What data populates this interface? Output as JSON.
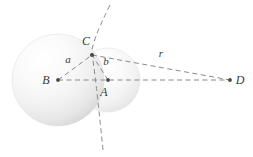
{
  "figure": {
    "background_color": "#ffffff",
    "line_color": "#7a7a7a",
    "label_color": "#3a3a3a",
    "sphere_fill_light": "#fdfdfd",
    "sphere_fill_mid": "#f0f0f0",
    "sphere_fill_dark": "#dcdcdc"
  },
  "labels": {
    "point_A": "A",
    "point_B": "B",
    "point_C": "C",
    "point_D": "D",
    "segment_a": "a",
    "segment_b": "b",
    "segment_r": "r"
  },
  "geometry": {
    "spheres": [
      {
        "name": "large-sphere",
        "center_label": "B",
        "cx": 58,
        "cy": 80,
        "r": 46
      },
      {
        "name": "small-sphere",
        "center_label": "A",
        "cx": 108,
        "cy": 80,
        "r": 32
      }
    ],
    "points": [
      {
        "name": "B",
        "x": 58,
        "y": 80
      },
      {
        "name": "A",
        "x": 108,
        "y": 80
      },
      {
        "name": "C",
        "x": 92,
        "y": 55
      },
      {
        "name": "D",
        "x": 230,
        "y": 80
      }
    ],
    "segments": [
      {
        "name": "a",
        "from": "B",
        "to": "C",
        "style": "dashed"
      },
      {
        "name": "b",
        "from": "A",
        "to": "C",
        "style": "dashed"
      },
      {
        "name": "r",
        "from": "C",
        "to": "D",
        "style": "dashed"
      },
      {
        "name": "axis",
        "from": "B",
        "to": "D",
        "style": "dashed"
      }
    ],
    "arcs": [
      {
        "name": "tangent-plane-arc",
        "through": "C",
        "style": "dashed"
      }
    ]
  },
  "label_positions": {
    "A": {
      "x": 104,
      "y": 96
    },
    "B": {
      "x": 46,
      "y": 84
    },
    "C": {
      "x": 86,
      "y": 44
    },
    "D": {
      "x": 238,
      "y": 84
    },
    "a": {
      "x": 67,
      "y": 62
    },
    "b": {
      "x": 105,
      "y": 65
    },
    "r": {
      "x": 160,
      "y": 57
    }
  }
}
